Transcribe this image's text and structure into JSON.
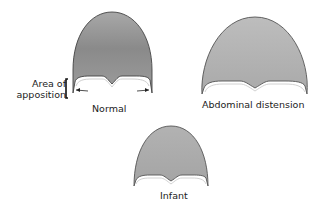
{
  "diagram": {
    "panels": [
      {
        "id": "normal",
        "label": "Normal"
      },
      {
        "id": "abdominal",
        "label": "Abdominal distension"
      },
      {
        "id": "infant",
        "label": "Infant"
      }
    ],
    "annotation": {
      "line1": "Area of",
      "line2": "apposition"
    },
    "colors": {
      "dome_fill": "#9a9a9a",
      "dome_fill_light": "#b8b8b8",
      "outline": "#444444",
      "background": "#ffffff"
    }
  }
}
